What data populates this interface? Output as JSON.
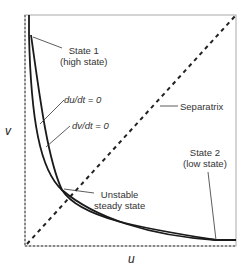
{
  "diagram": {
    "type": "phase-plane",
    "axes": {
      "x_label": "u",
      "y_label": "v"
    },
    "labels": {
      "state1_line1": "State 1",
      "state1_line2": "(high state)",
      "du_nullcline": "du/dt = 0",
      "dv_nullcline": "dv/dt = 0",
      "separatrix": "Separatrix",
      "unstable_line1": "Unstable",
      "unstable_line2": "steady state",
      "state2_line1": "State 2",
      "state2_line2": "(low state)"
    },
    "colors": {
      "curve": "#1a1a1a",
      "axis": "#999999",
      "text": "#333333"
    }
  }
}
